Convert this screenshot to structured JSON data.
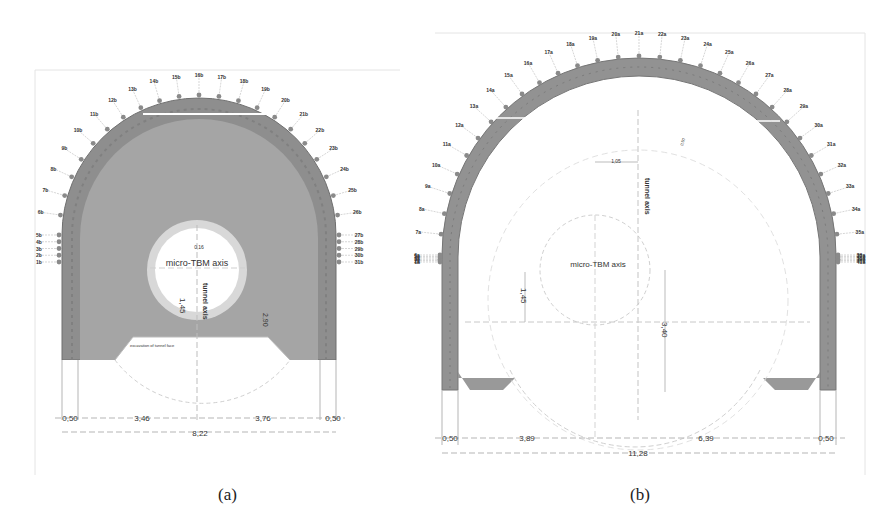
{
  "figure": {
    "panels": [
      {
        "id": "a",
        "caption": "(a)",
        "labels": {
          "micro_tbm_axis": "micro-TBM axis",
          "tunnel_axis": "tunnel axis",
          "small_offset": "0,16",
          "vertical_dim": "1,45",
          "right_vertical_dim": "2,90",
          "invert_note": "excavation of tunnel face"
        },
        "outer_points": [
          "1b",
          "2b",
          "3b",
          "4b",
          "5b",
          "6b",
          "7b",
          "8b",
          "9b",
          "10b",
          "11b",
          "12b",
          "13b",
          "14b",
          "15b",
          "16b",
          "17b",
          "18b",
          "19b",
          "20b",
          "21b",
          "22b",
          "23b",
          "24b",
          "25b",
          "26b",
          "27b",
          "28b",
          "29b",
          "30b",
          "31b"
        ],
        "dimensions": {
          "left_wall": "0,50",
          "left_half": "3,46",
          "right_half": "3,76",
          "right_wall": "0,50",
          "total": "8,22"
        }
      },
      {
        "id": "b",
        "caption": "(b)",
        "labels": {
          "micro_tbm_axis": "micro-TBM axis",
          "tunnel_axis": "tunnel axis",
          "offset_dim": "1,05",
          "vertical_dim": "1,45",
          "right_vertical_dim": "3,40",
          "inner_note": "0,50"
        },
        "outer_points": [
          "1a",
          "2a",
          "3a",
          "4a",
          "5a",
          "6a",
          "7a",
          "8a",
          "9a",
          "10a",
          "11a",
          "12a",
          "13a",
          "14a",
          "15a",
          "16a",
          "17a",
          "18a",
          "19a",
          "20a",
          "21a",
          "22a",
          "23a",
          "24a",
          "25a",
          "26a",
          "27a",
          "28a",
          "29a",
          "30a",
          "31a",
          "32a",
          "33a",
          "34a",
          "35a",
          "36a",
          "37a",
          "38a",
          "39a",
          "40a",
          "41a"
        ],
        "dimensions": {
          "left_wall": "0,50",
          "left_half": "3,89",
          "right_half": "6,39",
          "right_wall": "0,50",
          "total": "11,28"
        }
      }
    ],
    "colors": {
      "lining_fill": "#9a9a9a",
      "lining_dark": "#7d7d7d",
      "core_fill": "#a7a7a7",
      "dim_line": "#b5b5b5",
      "text": "#222222"
    }
  }
}
